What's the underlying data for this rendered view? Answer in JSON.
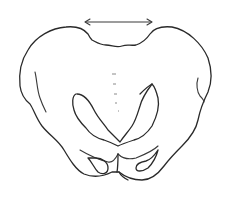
{
  "figure": {
    "annotation": {
      "type": "double-headed-arrow",
      "meaning": "width measurement across top",
      "x_start": 85,
      "x_end": 152,
      "y": 22
    },
    "colors": {
      "stroke": "#2a2a2a",
      "background": "#ffffff",
      "midline_marks": "#8a8a8a"
    },
    "midline_marks_count": 5
  }
}
